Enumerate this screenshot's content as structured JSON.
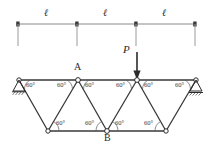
{
  "figure": {
    "dimension": {
      "labels": [
        "ℓ",
        "ℓ",
        "ℓ"
      ],
      "tick_x": [
        18,
        77,
        136,
        195
      ],
      "line_y": 24,
      "ext_bottom_y": 46
    },
    "load": {
      "label": "P",
      "arrow_x": 137,
      "arrow_top_y": 52,
      "arrow_tip_y": 79,
      "label_x": 123,
      "label_y": 48
    },
    "nodes": {
      "top": [
        {
          "name": "left-support-node",
          "x": 19,
          "y": 80,
          "label": ""
        },
        {
          "name": "node-a",
          "x": 78,
          "y": 80,
          "label": "A"
        },
        {
          "name": "node-load",
          "x": 137,
          "y": 80,
          "label": ""
        },
        {
          "name": "right-support-node",
          "x": 196,
          "y": 80,
          "label": ""
        }
      ],
      "bottom": [
        {
          "name": "bottom-node-1",
          "x": 48,
          "y": 131,
          "label": ""
        },
        {
          "name": "node-b",
          "x": 107,
          "y": 131,
          "label": "B"
        },
        {
          "name": "bottom-node-3",
          "x": 166,
          "y": 131,
          "label": ""
        }
      ]
    },
    "node_labels": {
      "a": "A",
      "b": "B",
      "a_x": 74,
      "a_y": 62,
      "b_x": 104,
      "b_y": 134
    },
    "angles": {
      "value": "60°",
      "top": [
        {
          "x": 25,
          "y": 82
        },
        {
          "x": 56,
          "y": 82
        },
        {
          "x": 84,
          "y": 82
        },
        {
          "x": 115,
          "y": 82
        },
        {
          "x": 143,
          "y": 82
        },
        {
          "x": 174,
          "y": 82
        }
      ],
      "bottom": [
        {
          "x": 54,
          "y": 122
        },
        {
          "x": 85,
          "y": 122
        },
        {
          "x": 113,
          "y": 122
        },
        {
          "x": 144,
          "y": 122
        }
      ]
    },
    "supports": {
      "left": {
        "type": "pin",
        "x": 19,
        "y": 80
      },
      "right": {
        "type": "roller",
        "x": 196,
        "y": 80
      }
    },
    "colors": {
      "member": "#3a3a3a",
      "dimension": "#7a7a7a",
      "text": "#2b2b2b",
      "node_fill": "#ffffff",
      "background": "#ffffff"
    }
  }
}
